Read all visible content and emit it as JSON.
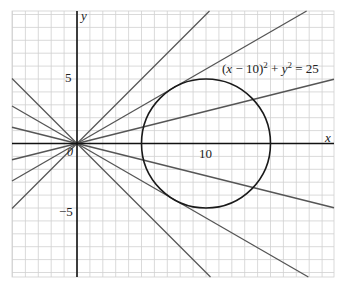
{
  "diagram": {
    "axes": {
      "x_label": "x",
      "y_label": "y",
      "origin_label": "0",
      "x_tick_labels": [
        {
          "value": 10,
          "text": "10"
        }
      ],
      "y_tick_labels": [
        {
          "value": 5,
          "text": "5"
        },
        {
          "value": -5,
          "text": "−5"
        }
      ],
      "x_range": [
        -5,
        20
      ],
      "y_range": [
        -10.4,
        10.2
      ],
      "grid": true,
      "grid_step": 1
    },
    "circle": {
      "center": [
        10,
        0
      ],
      "radius": 5,
      "equation_text": {
        "part1": "(",
        "x": "x",
        "part2": " − 10)",
        "sup1": "2",
        "part3": " + ",
        "y": "y",
        "sup2": "2",
        "part4": " = 25"
      }
    },
    "lines_through_origin": {
      "slopes": [
        1,
        0.577,
        0.25,
        -0.25,
        -0.577,
        -1
      ],
      "note_visible": false
    },
    "colors": {
      "grid": "#d0d0d0",
      "axis": "#111111",
      "line": "#555555",
      "circle": "#1a1a1a"
    }
  }
}
